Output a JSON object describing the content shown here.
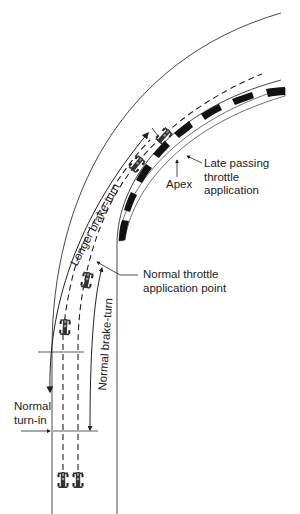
{
  "diagram": {
    "labels": {
      "apex": "Apex",
      "late_passing_line1": "Late passing",
      "late_passing_line2": "throttle",
      "late_passing_line3": "application",
      "normal_throttle_line1": "Normal throttle",
      "normal_throttle_line2": "application point",
      "normal_turn_in_line1": "Normal",
      "normal_turn_in_line2": "turn-in",
      "longer_brake_turn": "Longer brake-turn",
      "normal_brake_turn": "Normal brake-turn"
    },
    "colors": {
      "line": "#222222",
      "curb_dark": "#111111",
      "background": "#ffffff"
    },
    "elements": [
      {
        "type": "track-edge",
        "name": "outer-edge"
      },
      {
        "type": "track-edge",
        "name": "inner-edge"
      },
      {
        "type": "curb",
        "name": "checkered-apex-curb"
      },
      {
        "type": "racing-line",
        "name": "normal-line",
        "style": "dashed"
      },
      {
        "type": "racing-line",
        "name": "passing-line",
        "style": "dashed"
      },
      {
        "type": "car",
        "count": 6
      },
      {
        "type": "marker",
        "name": "normal-turn-in-line"
      },
      {
        "type": "marker",
        "name": "late-turn-in-line"
      }
    ]
  }
}
